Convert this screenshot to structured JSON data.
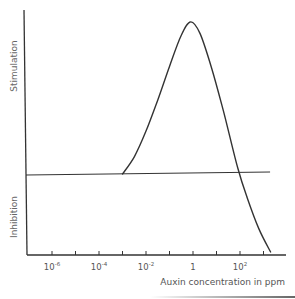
{
  "chart_data": {
    "type": "line",
    "title": "",
    "xlabel": "Auxin concentration in ppm",
    "ylabel": "",
    "y_region_labels": {
      "upper": "Stimulation",
      "lower": "Inhibition"
    },
    "x_scale": "log10",
    "x_ticks_exponents": [
      -6,
      -5,
      -4,
      -3,
      -2,
      -1,
      0,
      1,
      2,
      3
    ],
    "x_tick_labels": [
      {
        "exp": -6,
        "base": "10",
        "sup": "-6"
      },
      {
        "exp": -4,
        "base": "10",
        "sup": "-4"
      },
      {
        "exp": -2,
        "base": "10",
        "sup": "-2"
      },
      {
        "exp": 0,
        "base": "1",
        "sup": ""
      },
      {
        "exp": 2,
        "base": "10",
        "sup": "2"
      }
    ],
    "y_units": "relative response (0 = no effect, positive = stimulation, negative = inhibition)",
    "ylim": [
      -1,
      1.95
    ],
    "xlim_exponent": [
      -7,
      3.9
    ],
    "baseline": {
      "value": 0,
      "from_exponent": -7,
      "to_exponent": 3.3
    },
    "series": [
      {
        "name": "Auxin response",
        "x_exponent": [
          -3.0,
          -2.5,
          -2.0,
          -1.5,
          -1.0,
          -0.5,
          -0.1,
          0.3,
          0.8,
          1.3,
          1.9,
          2.3,
          2.8,
          3.3
        ],
        "values": [
          0.0,
          0.22,
          0.55,
          0.95,
          1.38,
          1.78,
          1.95,
          1.8,
          1.35,
          0.8,
          0.08,
          -0.3,
          -0.7,
          -1.0
        ]
      }
    ],
    "grid": false,
    "legend": null
  },
  "colors": {
    "line": "#333333",
    "axis": "#333333",
    "text": "#555555"
  }
}
